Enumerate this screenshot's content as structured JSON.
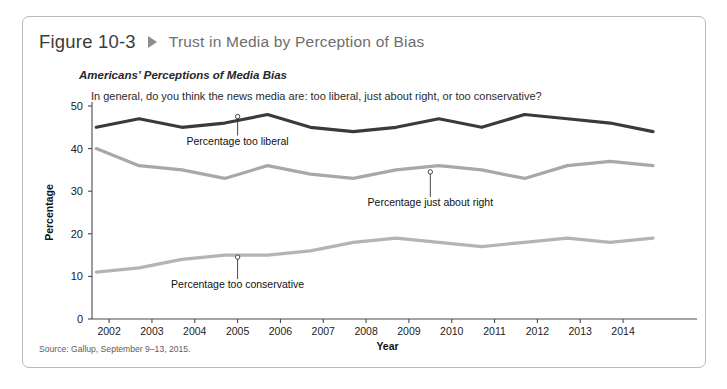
{
  "figure": {
    "number": "Figure 10-3",
    "separator_icon": "triangle-right-icon",
    "title": "Trust in Media by Perception of Bias",
    "subtitle": "Americans’ Perceptions of Media Bias",
    "question": "In general, do you think the news media are: too liberal, just about right, or too conservative?",
    "source": "Source: Gallup, September 9–13, 2015."
  },
  "colors": {
    "too_liberal": "#3a3a3a",
    "just_about_right": "#a8a8a8",
    "too_conservative": "#b4b4b4",
    "axis": "#4a4a4a",
    "border": "#b9b9b9",
    "title_gray": "#6e6e6e",
    "triangle_gray": "#8d8d8d"
  },
  "chart_data": {
    "type": "line",
    "title": "Americans’ Perceptions of Media Bias",
    "subtitle": "In general, do you think the news media are: too liberal, just about right, or too conservative?",
    "xlabel": "Year",
    "ylabel": "Percentage",
    "xlim": [
      2001.6,
      2015.4
    ],
    "ylim": [
      0,
      50
    ],
    "yticks": [
      0,
      10,
      20,
      30,
      40,
      50
    ],
    "xticks": [
      2002,
      2003,
      2004,
      2005,
      2006,
      2007,
      2008,
      2009,
      2010,
      2011,
      2012,
      2013,
      2014
    ],
    "grid": false,
    "legend": "inline-labels",
    "x": [
      2001.7,
      2002.7,
      2003.7,
      2004.7,
      2005.7,
      2006.7,
      2007.7,
      2008.7,
      2009.7,
      2010.7,
      2011.7,
      2012.7,
      2013.7,
      2014.7
    ],
    "series": [
      {
        "name": "Percentage too liberal",
        "color": "#3a3a3a",
        "values": [
          45,
          47,
          45,
          46,
          48,
          45,
          44,
          45,
          47,
          45,
          48,
          47,
          46,
          44
        ]
      },
      {
        "name": "Percentage just about right",
        "color": "#a8a8a8",
        "values": [
          40,
          36,
          35,
          33,
          36,
          34,
          33,
          35,
          36,
          35,
          33,
          36,
          37,
          36
        ]
      },
      {
        "name": "Percentage too conservative",
        "color": "#b4b4b4",
        "values": [
          11,
          12,
          14,
          15,
          15,
          16,
          18,
          19,
          18,
          17,
          18,
          19,
          18,
          19
        ]
      }
    ],
    "annotations": [
      {
        "label": "Percentage too liberal",
        "series": "Percentage too liberal",
        "anchor_year": 2005,
        "anchor_value": 48
      },
      {
        "label": "Percentage just about right",
        "series": "Percentage just about right",
        "anchor_year": 2009.5,
        "anchor_value": 35
      },
      {
        "label": "Percentage too conservative",
        "series": "Percentage too conservative",
        "anchor_year": 2005,
        "anchor_value": 15
      }
    ]
  }
}
